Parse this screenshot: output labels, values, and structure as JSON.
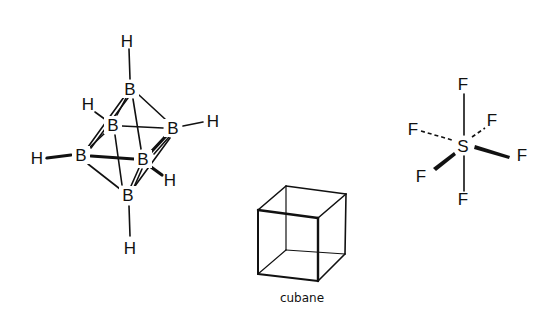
{
  "figure": {
    "molecules": [
      {
        "id": "borane",
        "atoms": [
          {
            "symbol": "H",
            "pos": "top"
          },
          {
            "symbol": "B",
            "pos": "top"
          },
          {
            "symbol": "H",
            "pos": "upper-left"
          },
          {
            "symbol": "B",
            "pos": "upper-left-back"
          },
          {
            "symbol": "B",
            "pos": "right"
          },
          {
            "symbol": "H",
            "pos": "right"
          },
          {
            "symbol": "H",
            "pos": "left"
          },
          {
            "symbol": "B",
            "pos": "left"
          },
          {
            "symbol": "B",
            "pos": "front-right"
          },
          {
            "symbol": "H",
            "pos": "front-right"
          },
          {
            "symbol": "B",
            "pos": "bottom"
          },
          {
            "symbol": "H",
            "pos": "bottom"
          }
        ]
      },
      {
        "id": "cubane",
        "label": "cubane"
      },
      {
        "id": "sulfur-hexafluoride",
        "atoms": [
          {
            "symbol": "F",
            "pos": "top"
          },
          {
            "symbol": "F",
            "pos": "left"
          },
          {
            "symbol": "F",
            "pos": "upper-right"
          },
          {
            "symbol": "S",
            "pos": "center"
          },
          {
            "symbol": "F",
            "pos": "right"
          },
          {
            "symbol": "F",
            "pos": "lower-left"
          },
          {
            "symbol": "F",
            "pos": "bottom"
          }
        ]
      }
    ]
  }
}
